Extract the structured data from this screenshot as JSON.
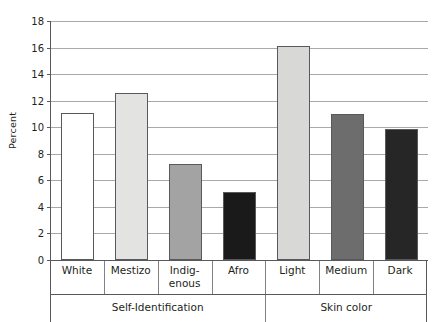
{
  "chart_data": {
    "type": "bar",
    "title": "",
    "subtitle": "",
    "xlabel": "",
    "ylabel": "Percent",
    "ylim": [
      0,
      18
    ],
    "ytick_step": 2,
    "yticks": [
      "0",
      "2",
      "4",
      "6",
      "8",
      "10",
      "12",
      "14",
      "16",
      "18"
    ],
    "grid": true,
    "legend": "none",
    "categories": [
      "White",
      "Mestizo",
      "Indig-\nenous",
      "Afro",
      "Light",
      "Medium",
      "Dark"
    ],
    "values": [
      11.1,
      12.6,
      7.2,
      5.1,
      16.1,
      11.0,
      9.9
    ],
    "bar_colors": [
      "#ffffff",
      "#e3e3e1",
      "#a2a3a2",
      "#1a1a1a",
      "#d8d9d7",
      "#6c6d6c",
      "#262626"
    ],
    "bar_edge_color": "#58595b",
    "groups": [
      {
        "label": "Self-Identification",
        "categories": [
          "White",
          "Mestizo",
          "Indig-enous",
          "Afro"
        ]
      },
      {
        "label": "Skin color",
        "categories": [
          "Light",
          "Medium",
          "Dark"
        ]
      }
    ],
    "axis_color": "#58595b",
    "gridline_color": "#a7a9ac",
    "background": "#ffffff"
  },
  "categories_display": [
    {
      "line1": "White",
      "line2": ""
    },
    {
      "line1": "Mestizo",
      "line2": ""
    },
    {
      "line1": "Indig-",
      "line2": "enous"
    },
    {
      "line1": "Afro",
      "line2": ""
    },
    {
      "line1": "Light",
      "line2": ""
    },
    {
      "line1": "Medium",
      "line2": ""
    },
    {
      "line1": "Dark",
      "line2": ""
    }
  ],
  "groups_display": [
    {
      "label": "Self-Identification"
    },
    {
      "label": "Skin color"
    }
  ]
}
